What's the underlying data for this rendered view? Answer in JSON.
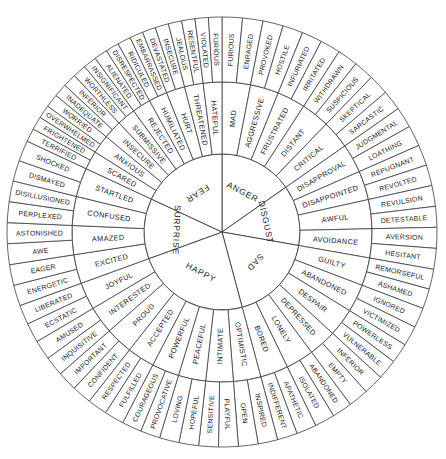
{
  "colors": {
    "stroke": "#3c3c46",
    "text": "#1a1a1a",
    "background": "#ffffff"
  },
  "geometry": {
    "cx": 222,
    "cy": 232,
    "r_inner": 78,
    "r_mid": 150,
    "r_outer": 215,
    "start_angle_deg": -90
  },
  "chart_data": {
    "type": "pie",
    "rings": [
      "core",
      "secondary",
      "tertiary"
    ],
    "core_emotions": [
      {
        "name": "ANGER",
        "weight": 11,
        "secondary": [
          {
            "name": "MAD",
            "tertiary": [
              "FURIOUS",
              "ENRAGED"
            ]
          },
          {
            "name": "AGGRESSIVE",
            "tertiary": [
              "PROVOKED",
              "HOSTILE"
            ]
          },
          {
            "name": "FRUSTRATED",
            "tertiary": [
              "INFURIATED",
              "IRRITATED"
            ]
          },
          {
            "name": "DISTANT",
            "tertiary": [
              "WITHDRAWN",
              "SUSPICIOUS"
            ]
          },
          {
            "name": "CRITICAL",
            "tertiary": [
              "SKEPTICAL",
              "SARCASTIC"
            ]
          }
        ]
      },
      {
        "name": "DISGUST",
        "weight": 9,
        "secondary": [
          {
            "name": "DISAPPROVAL",
            "tertiary": [
              "JUDGMENTAL",
              "LOATHING"
            ]
          },
          {
            "name": "DISAPPOINTED",
            "tertiary": [
              "REPUGNANT",
              "REVOLTED"
            ]
          },
          {
            "name": "AWFUL",
            "tertiary": [
              "REVULSION",
              "DETESTABLE"
            ]
          },
          {
            "name": "AVOIDANCE",
            "tertiary": [
              "AVERSION",
              "HESITANT"
            ]
          }
        ]
      },
      {
        "name": "SAD",
        "weight": 13,
        "secondary": [
          {
            "name": "GUILTY",
            "tertiary": [
              "REMORSEFUL",
              "ASHAMED"
            ]
          },
          {
            "name": "ABANDONED",
            "tertiary": [
              "IGNORED",
              "VICTIMIZED"
            ]
          },
          {
            "name": "DESPAIR",
            "tertiary": [
              "POWERLESS",
              "VULNERABLE"
            ]
          },
          {
            "name": "DEPRESSED",
            "tertiary": [
              "INFERIOR",
              "EMPTY"
            ]
          },
          {
            "name": "LONELY",
            "tertiary": [
              "ABANDONED",
              "ISOLATED"
            ]
          },
          {
            "name": "BORED",
            "tertiary": [
              "APATHETIC",
              "INDIFFERENT"
            ]
          }
        ]
      },
      {
        "name": "HAPPY",
        "weight": 17,
        "secondary": [
          {
            "name": "OPTIMISTIC",
            "tertiary": [
              "INSPIRED",
              "OPEN"
            ]
          },
          {
            "name": "INTIMATE",
            "tertiary": [
              "PLAYFUL",
              "SENSITIVE"
            ]
          },
          {
            "name": "PEACEFUL",
            "tertiary": [
              "HOPEFUL",
              "LOVING"
            ]
          },
          {
            "name": "POWERFUL",
            "tertiary": [
              "PROVOCATIVE",
              "COURAGEOUS"
            ]
          },
          {
            "name": "ACCEPTED",
            "tertiary": [
              "FULFILLED",
              "RESPECTED"
            ]
          },
          {
            "name": "PROUD",
            "tertiary": [
              "CONFIDENT",
              "IMPORTANT"
            ]
          },
          {
            "name": "INTERESTED",
            "tertiary": [
              "INQUISITIVE",
              "AMUSED"
            ]
          },
          {
            "name": "JOYFUL",
            "tertiary": [
              "ECSTATIC",
              "LIBERATED"
            ]
          }
        ]
      },
      {
        "name": "SURPRISE",
        "weight": 9,
        "secondary": [
          {
            "name": "EXCITED",
            "tertiary": [
              "ENERGETIC",
              "EAGER"
            ]
          },
          {
            "name": "AMAZED",
            "tertiary": [
              "AWE",
              "ASTONISHED"
            ]
          },
          {
            "name": "CONFUSED",
            "tertiary": [
              "PERPLEXED",
              "DISILLUSIONED"
            ]
          },
          {
            "name": "STARTLED",
            "tertiary": [
              "DISMAYED",
              "SHOCKED"
            ]
          }
        ]
      },
      {
        "name": "FEAR",
        "weight": 13,
        "secondary": [
          {
            "name": "SCARED",
            "tertiary": [
              "TERRIFIED",
              "FRIGHTENED"
            ]
          },
          {
            "name": "ANXIOUS",
            "tertiary": [
              "OVERWHELMED",
              "WORRIED"
            ]
          },
          {
            "name": "INSECURE",
            "tertiary": [
              "INADEQUATE",
              "INFERIOR"
            ]
          },
          {
            "name": "SUBMISSIVE",
            "tertiary": [
              "WORTHLESS",
              "INSIGNIFICANT"
            ]
          },
          {
            "name": "REJECTED",
            "tertiary": [
              "ALIENATED",
              "DISRESPECTED"
            ]
          },
          {
            "name": "HUMILIATED",
            "tertiary": [
              "RIDICULED",
              "EMBARRASSED"
            ]
          },
          {
            "name": "HURT",
            "tertiary": [
              "DEVASTATED",
              "INSECURE"
            ]
          },
          {
            "name": "THREATENED",
            "tertiary": [
              "JEALOUS",
              "RESENTFUL"
            ]
          },
          {
            "name": "HATEFUL",
            "tertiary": [
              "VIOLATED",
              "FURIOUS"
            ]
          }
        ]
      }
    ]
  }
}
